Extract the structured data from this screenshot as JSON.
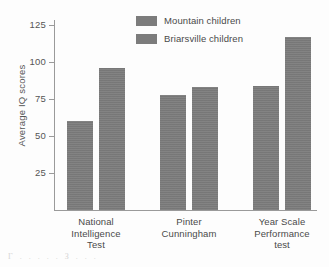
{
  "chart_data": {
    "type": "bar",
    "title": "",
    "xlabel": "",
    "ylabel": "Average IQ scores",
    "ylim": [
      0,
      131
    ],
    "yticks": [
      25,
      50,
      75,
      100,
      125
    ],
    "ytick_labels": [
      "25",
      "50",
      "75",
      "100",
      "125"
    ],
    "grid": false,
    "legend_position": "top-center",
    "categories": [
      "National Intelligence Test",
      "Pinter Cunningham",
      "Year Scale Performance test"
    ],
    "category_label_lines": [
      [
        "National",
        "Intelligence",
        "Test"
      ],
      [
        "Pinter",
        "Cunningham"
      ],
      [
        "Year Scale",
        "Performance",
        "test"
      ]
    ],
    "series": [
      {
        "name": "Mountain children",
        "values": [
          60,
          78,
          84
        ],
        "color": "#7c7c7c"
      },
      {
        "name": "Briarsville children",
        "values": [
          96,
          83,
          117
        ],
        "color": "#7c7c7c"
      }
    ]
  },
  "legend": {
    "entries": [
      {
        "label": "Mountain children"
      },
      {
        "label": "Briarsville children"
      }
    ]
  },
  "axes": {
    "y_title": "Average IQ scores",
    "y_tick_125": "125",
    "y_tick_100": "100",
    "y_tick_75": "75",
    "y_tick_50": "50",
    "y_tick_25": "25"
  },
  "categories": {
    "c0_l0": "National",
    "c0_l1": "Intelligence",
    "c0_l2": "Test",
    "c1_l0": "Pinter",
    "c1_l1": "Cunningham",
    "c2_l0": "Year Scale",
    "c2_l1": "Performance",
    "c2_l2": "test"
  },
  "artifact": {
    "caption_fragment": "Γ . . . . .   З   . .  ."
  }
}
